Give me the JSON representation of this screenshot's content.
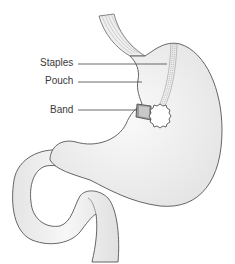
{
  "diagram": {
    "labels": [
      {
        "id": "staples",
        "text": "Staples"
      },
      {
        "id": "pouch",
        "text": "Pouch"
      },
      {
        "id": "band",
        "text": "Band"
      }
    ],
    "colors": {
      "organ_fill": "#ebebeb",
      "organ_highlight": "#f8f8f8",
      "outline": "#555555",
      "leader_line": "#444444",
      "band_fill": "#9a9a9a",
      "label_text": "#3a3a3a"
    }
  }
}
